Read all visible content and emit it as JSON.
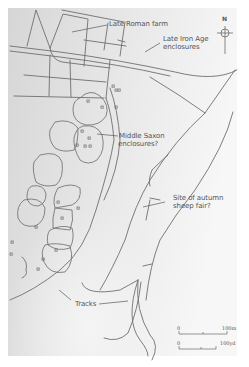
{
  "map": {
    "background_colors": {
      "dark": "#d7d7d7",
      "light": "#f6f6f6",
      "page": "#ffffff"
    },
    "line_color": "#6f6f6f",
    "text_color": "#555555"
  },
  "labels": {
    "late_roman_farm": "Late Roman farm",
    "late_iron_age_1": "Late Iron Age",
    "late_iron_age_2": "enclosures",
    "middle_saxon_1": "Middle Saxon",
    "middle_saxon_2": "enclosures?",
    "sheep_fair_1": "Site of autumn",
    "sheep_fair_2": "sheep fair?",
    "tracks": "Tracks"
  },
  "north_arrow": {
    "label": "N",
    "icon": "compass-crosshair-icon"
  },
  "scale_bars": [
    {
      "start": "0",
      "end": "100m"
    },
    {
      "start": "0",
      "end": "100yd"
    }
  ]
}
